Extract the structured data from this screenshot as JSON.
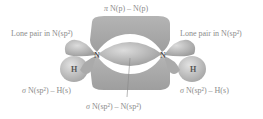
{
  "diagram": {
    "labels": {
      "pi_bond": {
        "sym": "π",
        "text": " N(p) – N(p)"
      },
      "lone_pair_left": {
        "text": "Lone pair in N(sp²)"
      },
      "lone_pair_right": {
        "text": "Lone pair in N(sp²)"
      },
      "sigma_nh_left": {
        "sym": "σ",
        "text": " N(sp²) – H(s)"
      },
      "sigma_nh_right": {
        "sym": "σ",
        "text": " N(sp²) – H(s)"
      },
      "sigma_nn": {
        "sym": "σ",
        "text": " N(sp²) – N(sp²)"
      }
    },
    "atoms": {
      "n_left": "N",
      "n_right": "N",
      "h_left": "H",
      "h_right": "H"
    },
    "colors": {
      "pi_lobe": "#a9a9a9",
      "sigma_lobe": "#b8b8b8",
      "lone_pair": "#b0b0b0",
      "h_sphere": "#c4c4c4",
      "text": "#8c8c8c"
    }
  }
}
